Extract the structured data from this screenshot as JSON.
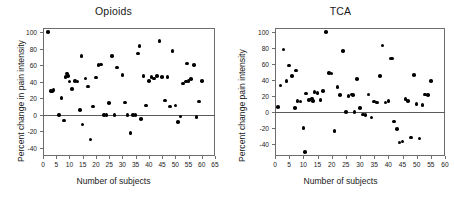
{
  "figure": {
    "background": "#ffffff",
    "point_color": "#000000",
    "axis_color": "#6d6d6d",
    "zero_line_color": "#5a5a5a"
  },
  "chart_data": [
    {
      "type": "scatter",
      "title": "Opioids",
      "xlabel": "Number of subjects",
      "ylabel": "Percent change in pain intensity",
      "xlim": [
        0,
        65
      ],
      "ylim": [
        -50,
        105
      ],
      "xticks": [
        0,
        5,
        10,
        15,
        20,
        25,
        30,
        35,
        40,
        45,
        50,
        55,
        60,
        65
      ],
      "yticks": [
        -40,
        -20,
        0,
        20,
        40,
        60,
        80,
        100
      ],
      "grid": false,
      "legend": "none",
      "zero_reference_line": 0,
      "x": [
        2,
        3,
        3.5,
        4,
        6,
        7,
        8,
        8.5,
        9,
        9.5,
        10,
        11,
        12,
        13,
        14,
        14.5,
        15,
        16,
        17,
        18,
        19,
        20,
        21,
        22,
        23,
        24,
        25,
        26,
        27,
        28,
        30,
        31,
        32,
        33,
        34,
        35,
        36,
        36.5,
        37,
        38,
        39,
        40,
        41,
        42,
        43,
        44,
        45,
        46,
        47,
        48,
        49,
        50,
        51,
        52,
        53,
        54,
        54.5,
        55,
        56,
        57,
        58,
        59,
        60
      ],
      "y": [
        100,
        29,
        28,
        30,
        0,
        20,
        -7,
        46,
        50,
        47,
        40,
        31,
        41,
        40,
        6,
        71,
        -12,
        44,
        34,
        -30,
        10,
        45,
        60,
        61,
        0,
        0,
        14,
        71,
        0,
        57,
        48,
        15,
        0,
        -22,
        0,
        0,
        74,
        83,
        -5,
        47,
        11,
        41,
        46,
        44,
        47,
        89,
        46,
        17,
        46,
        10,
        77,
        11,
        -9,
        -2,
        38,
        40,
        62,
        41,
        43,
        60,
        -3,
        16,
        41
      ]
    },
    {
      "type": "scatter",
      "title": "TCA",
      "xlabel": "Number of subjects",
      "ylabel": "Percent change pain intensity",
      "xlim": [
        0,
        60
      ],
      "ylim": [
        -55,
        105
      ],
      "xticks": [
        0,
        5,
        10,
        15,
        20,
        25,
        30,
        35,
        40,
        45,
        50,
        55,
        60
      ],
      "yticks": [
        -40,
        -20,
        0,
        20,
        40,
        60,
        80,
        100
      ],
      "grid": false,
      "legend": "none",
      "zero_reference_line": 0,
      "x": [
        1,
        2,
        3,
        4,
        5,
        6,
        7,
        7.5,
        8,
        9,
        10,
        10.5,
        11,
        12,
        13,
        13.5,
        14,
        15,
        16,
        17,
        18,
        19,
        20,
        21,
        22,
        23,
        24,
        25,
        26,
        27,
        27.5,
        28,
        29,
        30,
        31,
        32,
        33,
        34,
        35,
        36,
        37,
        38,
        39,
        40,
        41,
        41.5,
        42,
        43,
        44,
        45,
        46,
        47,
        48,
        49,
        50,
        51,
        52,
        53,
        54,
        55
      ],
      "y": [
        6,
        33,
        78,
        39,
        58,
        45,
        5,
        52,
        14,
        13,
        -20,
        -50,
        23,
        15,
        17,
        14,
        25,
        24,
        15,
        26,
        100,
        49,
        48,
        -24,
        31,
        21,
        76,
        0,
        20,
        22,
        21,
        0,
        41,
        5,
        -3,
        -4,
        22,
        -7,
        13,
        12,
        45,
        83,
        12,
        14,
        67,
        67,
        -12,
        -21,
        -38,
        -37,
        16,
        14,
        -32,
        46,
        10,
        -33,
        9,
        22,
        21,
        39,
        20,
        59
      ]
    }
  ]
}
